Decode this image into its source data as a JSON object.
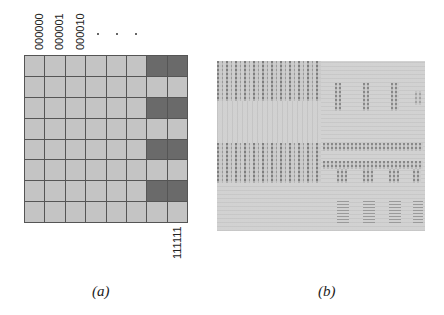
{
  "panel_a": {
    "column_labels": [
      "000000",
      "000001",
      "000010"
    ],
    "ellipsis": ". . .",
    "last_label": "111111",
    "grid": {
      "rows": 8,
      "cols": 8,
      "cell_color": "#c4c4c4",
      "dark_color": "#6a6a6a",
      "line_color": "#555555",
      "dark_cells": [
        [
          0,
          6
        ],
        [
          0,
          7
        ],
        [
          2,
          6
        ],
        [
          2,
          7
        ],
        [
          4,
          6
        ],
        [
          4,
          7
        ],
        [
          6,
          6
        ],
        [
          6,
          7
        ]
      ]
    },
    "caption": "(a)"
  },
  "panel_b": {
    "description": "grayscale texture image with vertical stripe patterns (top-left, middle-left), dotted blocks (right middle), horizontal bar blocks (bottom right)",
    "background_color": "#cfcfcf",
    "caption": "(b)"
  }
}
